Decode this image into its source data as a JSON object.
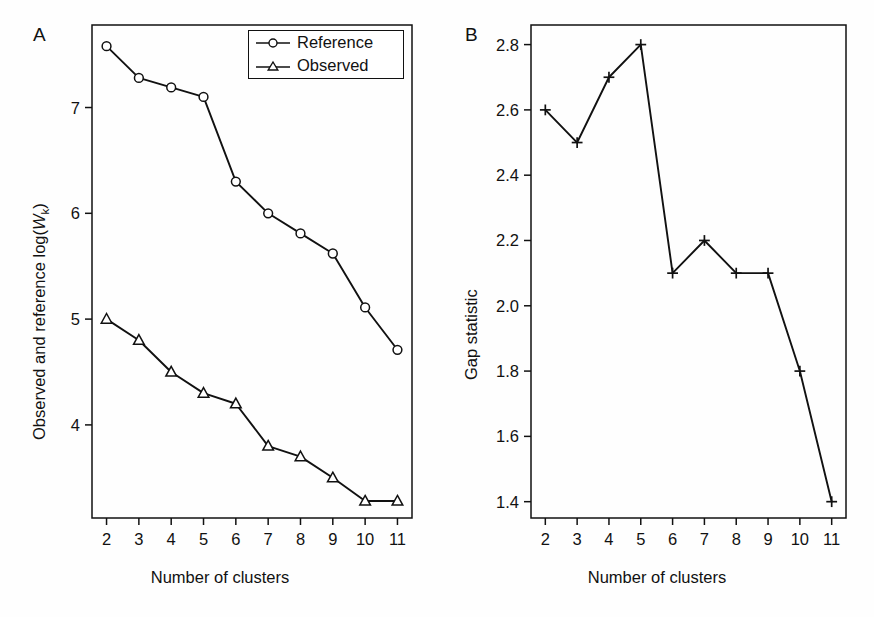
{
  "figure": {
    "panels": [
      {
        "letter": "A",
        "xlabel": "Number of clusters",
        "ylabel_prefix": "Observed and reference log(",
        "ylabel_italic": "W",
        "ylabel_sub": "k",
        "ylabel_suffix": ")",
        "legend": [
          {
            "label": "Reference",
            "marker": "circle"
          },
          {
            "label": "Observed",
            "marker": "triangle"
          }
        ]
      },
      {
        "letter": "B",
        "xlabel": "Number of clusters",
        "ylabel": "Gap statistic"
      }
    ]
  },
  "chart_data": [
    {
      "type": "line",
      "panel": "A",
      "title": "",
      "xlabel": "Number of clusters",
      "ylabel": "Observed and reference log(W_k)",
      "x": [
        2,
        3,
        4,
        5,
        6,
        7,
        8,
        9,
        10,
        11
      ],
      "xticks": [
        "2",
        "3",
        "4",
        "5",
        "6",
        "7",
        "8",
        "9",
        "10",
        "11"
      ],
      "yticks": [
        "4",
        "5",
        "6",
        "7"
      ],
      "ytick_values": [
        4,
        5,
        6,
        7
      ],
      "xlim": [
        1.55,
        11.45
      ],
      "ylim": [
        3.12,
        7.78
      ],
      "grid": false,
      "legend_position": "top-right",
      "series": [
        {
          "name": "Reference",
          "marker": "circle",
          "values": [
            7.58,
            7.28,
            7.19,
            7.1,
            6.3,
            6.0,
            5.81,
            5.62,
            5.11,
            4.71
          ]
        },
        {
          "name": "Observed",
          "marker": "triangle",
          "values": [
            5.0,
            4.8,
            4.5,
            4.3,
            4.2,
            3.8,
            3.7,
            3.5,
            3.28,
            3.28
          ]
        }
      ]
    },
    {
      "type": "line",
      "panel": "B",
      "title": "",
      "xlabel": "Number of clusters",
      "ylabel": "Gap statistic",
      "x": [
        2,
        3,
        4,
        5,
        6,
        7,
        8,
        9,
        10,
        11
      ],
      "xticks": [
        "2",
        "3",
        "4",
        "5",
        "6",
        "7",
        "8",
        "9",
        "10",
        "11"
      ],
      "yticks": [
        "1.4",
        "1.6",
        "1.8",
        "2.0",
        "2.2",
        "2.4",
        "2.6",
        "2.8"
      ],
      "ytick_values": [
        1.4,
        1.6,
        1.8,
        2.0,
        2.2,
        2.4,
        2.6,
        2.8
      ],
      "xlim": [
        1.55,
        11.45
      ],
      "ylim": [
        1.35,
        2.86
      ],
      "grid": false,
      "legend_position": "none",
      "series": [
        {
          "name": "Gap statistic",
          "marker": "plus",
          "values": [
            2.6,
            2.5,
            2.7,
            2.8,
            2.1,
            2.2,
            2.1,
            2.1,
            1.8,
            1.4
          ]
        }
      ]
    }
  ],
  "colors": {
    "line": "#111111",
    "marker_fill": "#ffffff",
    "frame": "#111111",
    "text": "#111111",
    "background": "#ffffff"
  }
}
